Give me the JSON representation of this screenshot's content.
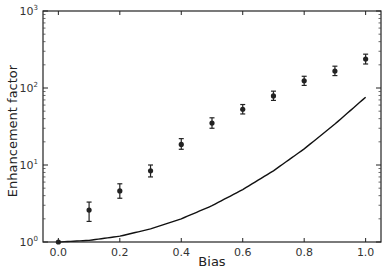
{
  "chart_data": {
    "type": "scatter",
    "title": "",
    "xlabel": "Bias",
    "ylabel": "Enhancement factor",
    "xlim": [
      -0.05,
      1.05
    ],
    "ylim": [
      1,
      1000
    ],
    "yscale": "log",
    "grid": false,
    "legend": null,
    "x_ticks": [
      "0.0",
      "0.2",
      "0.4",
      "0.6",
      "0.8",
      "1.0"
    ],
    "y_ticks": [
      {
        "base": "10",
        "exp": "0"
      },
      {
        "base": "10",
        "exp": "1"
      },
      {
        "base": "10",
        "exp": "2"
      },
      {
        "base": "10",
        "exp": "3"
      }
    ],
    "series": [
      {
        "name": "measured",
        "kind": "errorbar",
        "color": "#222222",
        "x": [
          0.0,
          0.1,
          0.2,
          0.3,
          0.4,
          0.5,
          0.6,
          0.7,
          0.8,
          0.9,
          1.0
        ],
        "y": [
          1.0,
          2.6,
          4.6,
          8.4,
          18.5,
          35,
          53,
          79,
          124,
          166,
          238
        ],
        "y_low": [
          1.0,
          1.85,
          3.7,
          7.0,
          16,
          30,
          46,
          69,
          108,
          145,
          205
        ],
        "y_high": [
          1.0,
          3.3,
          5.7,
          10.0,
          22,
          41,
          61,
          91,
          142,
          192,
          275
        ]
      },
      {
        "name": "model",
        "kind": "line",
        "color": "#111111",
        "x": [
          0.0,
          0.1,
          0.2,
          0.3,
          0.4,
          0.5,
          0.6,
          0.7,
          0.8,
          0.9,
          1.0
        ],
        "y": [
          1.0,
          1.05,
          1.19,
          1.48,
          2.0,
          2.96,
          4.8,
          8.4,
          16.2,
          34,
          76
        ]
      }
    ]
  }
}
